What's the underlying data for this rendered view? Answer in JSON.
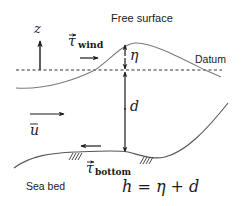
{
  "diagram": {
    "labels": {
      "free_surface": "Free surface",
      "datum": "Datum",
      "sea_bed": "Sea bed",
      "z_axis": "z",
      "eta": "η",
      "depth": "d",
      "velocity": "u",
      "tau": "τ",
      "wind_sub": "wind",
      "bottom_sub": "bottom",
      "equation": "h = η + d"
    },
    "colors": {
      "line": "#1a1a1a",
      "surface": "#7a7a7a",
      "background": "#ffffff"
    }
  }
}
